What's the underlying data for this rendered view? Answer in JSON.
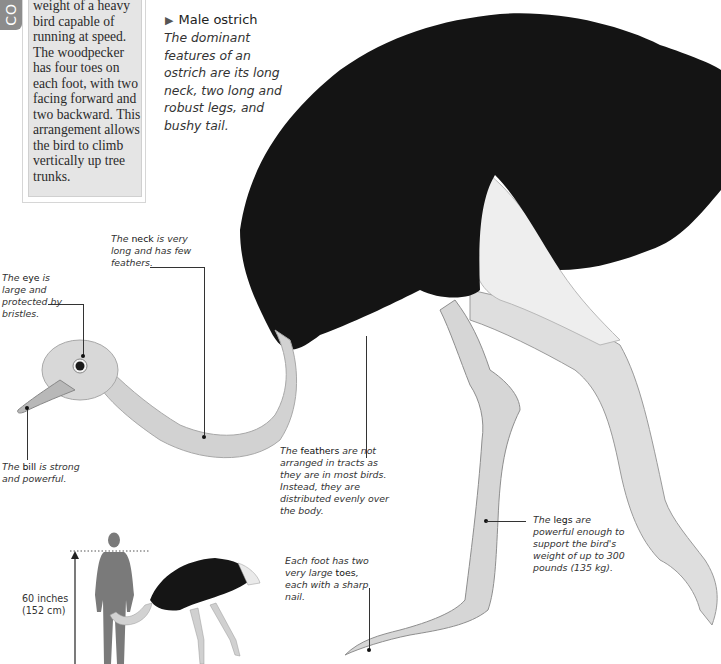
{
  "side_tab": {
    "label": "CO"
  },
  "sidebox": {
    "text": "weight of a heavy bird capable of running at speed. The woodpecker has four toes on each foot, with two facing forward and two backward. This arrangement allows the bird to climb vertically up tree trunks."
  },
  "figure": {
    "title": "Male ostrich",
    "title_marker": "▶",
    "description": "The dominant features of an ostrich are its long neck, two long and robust legs, and bushy tail."
  },
  "callouts": {
    "neck": {
      "pre": "The ",
      "term": "neck",
      "post": " is very long and has few feathers."
    },
    "eye": {
      "pre": "The ",
      "term": "eye",
      "post": "  is large and protected by bristles."
    },
    "bill": {
      "pre": "The ",
      "term": "bill",
      "post": " is strong and powerful."
    },
    "feathers": {
      "pre": "The ",
      "term": "feathers",
      "post": " are not arranged in tracts as they are in most birds. Instead, they are distributed evenly over the body."
    },
    "legs": {
      "pre": "The ",
      "term": "legs",
      "post": " are powerful enough to support the bird's weight of up to 300 pounds (135 kg)."
    },
    "toes": {
      "pre": "Each foot has two very large ",
      "term": "toes",
      "post": ", each with a sharp nail."
    }
  },
  "scale": {
    "line1": "60 inches",
    "line2": "(152 cm)"
  },
  "colors": {
    "plumage_black": "#141414",
    "plumage_white": "#e8e8e8",
    "skin_grey": "#cfcfcf",
    "sidebox_bg": "#e5e5e5",
    "tab_grey": "#8c8c8c",
    "human_silhouette": "#777777"
  }
}
